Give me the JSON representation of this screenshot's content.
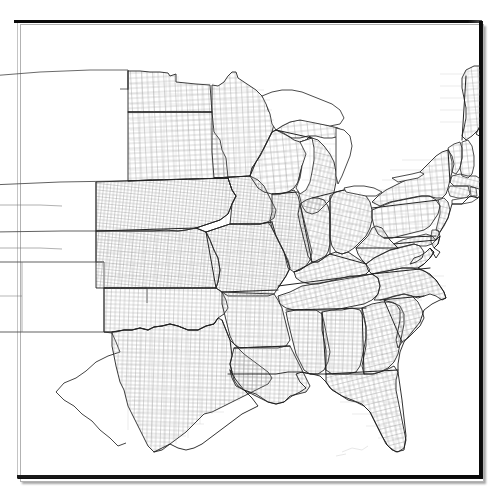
{
  "figure": {
    "kind": "map",
    "title": "",
    "background_color": "#ffffff",
    "frame": {
      "visible": true,
      "style": "thin dark rectangle with drop shadow",
      "color": "#0a0a0a",
      "shadow_color": "rgba(0,0,0,0.35)",
      "left": 17,
      "top": 21,
      "width": 464,
      "height": 456
    },
    "projection_note": "",
    "legend": {
      "visible": false,
      "entries": []
    },
    "scale_bar": {
      "visible": false,
      "label": ""
    },
    "north_arrow": {
      "visible": false
    },
    "labels": [],
    "colors": {
      "land_fill": "#ffffff",
      "water_fill": "#ffffff",
      "county_line": "#8a8a8a",
      "state_line": "#2b2b2b",
      "coastline": "#1f1f1f"
    },
    "line_widths": {
      "county": 0.35,
      "state": 0.9,
      "coast": 0.8
    },
    "regions": {
      "with_counties": [
        "North Dakota",
        "South Dakota",
        "Nebraska",
        "Kansas",
        "Oklahoma",
        "Texas",
        "Minnesota",
        "Iowa",
        "Missouri",
        "Arkansas",
        "Louisiana",
        "Wisconsin",
        "Illinois",
        "Michigan",
        "Indiana",
        "Ohio",
        "Kentucky",
        "Tennessee",
        "Mississippi",
        "Alabama",
        "Georgia",
        "Florida",
        "South Carolina",
        "North Carolina",
        "Virginia",
        "West Virginia",
        "Maryland",
        "Delaware",
        "Pennsylvania",
        "New Jersey",
        "New York",
        "Connecticut",
        "Rhode Island",
        "Massachusetts",
        "Vermont",
        "New Hampshire",
        "Maine"
      ],
      "outline_only": [
        "Montana",
        "Wyoming",
        "Colorado",
        "New Mexico",
        "Idaho",
        "Utah",
        "Nevada",
        "Arizona"
      ]
    }
  }
}
